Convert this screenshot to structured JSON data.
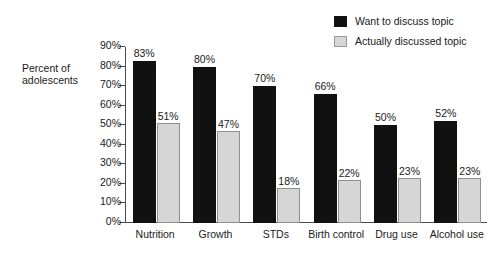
{
  "chart_data": {
    "type": "bar",
    "title": "",
    "xlabel": "",
    "ylabel": "Percent of adolescents",
    "ylabel_line1": "Percent of",
    "ylabel_line2": "adolescents",
    "ylim": [
      0,
      90
    ],
    "grid": false,
    "legend_position": "top-right",
    "ytick_labels": [
      "90%",
      "80%",
      "70%",
      "60%",
      "50%",
      "40%",
      "30%",
      "20%",
      "10%",
      "0%"
    ],
    "ytick_values": [
      90,
      80,
      70,
      60,
      50,
      40,
      30,
      20,
      10,
      0
    ],
    "categories": [
      "Nutrition",
      "Growth",
      "STDs",
      "Birth control",
      "Drug use",
      "Alcohol use"
    ],
    "series": [
      {
        "name": "Want to discuss topic",
        "color": "#111111",
        "values": [
          83,
          80,
          70,
          66,
          50,
          52
        ],
        "labels": [
          "83%",
          "80%",
          "70%",
          "66%",
          "50%",
          "52%"
        ]
      },
      {
        "name": "Actually discussed topic",
        "color": "#d6d6d6",
        "values": [
          51,
          47,
          18,
          22,
          23,
          23
        ],
        "labels": [
          "51%",
          "47%",
          "18%",
          "22%",
          "23%",
          "23%"
        ]
      }
    ]
  }
}
